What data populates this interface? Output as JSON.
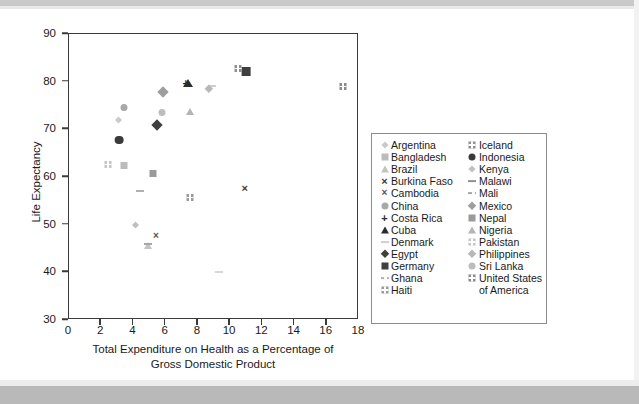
{
  "chart_data": {
    "type": "scatter",
    "title": "",
    "xlabel": "Total Expenditure on Health as a Percentage of Gross Domestic Product",
    "xlabel_line1": "Total Expenditure on Health as a Percentage of",
    "xlabel_line2": "Gross Domestic Product",
    "ylabel": "Life Expectancy",
    "xlim": [
      0,
      18
    ],
    "ylim": [
      30,
      90
    ],
    "xticks": [
      "0",
      "2",
      "4",
      "6",
      "8",
      "10",
      "12",
      "14",
      "16",
      "18"
    ],
    "yticks": [
      "30",
      "40",
      "50",
      "60",
      "70",
      "80",
      "90"
    ],
    "grid": false,
    "legend_position": "right",
    "points": [
      {
        "name": "Argentina",
        "x": 3.2,
        "y": 72.0,
        "marker": "diamond-small",
        "color": "#c9c9c9"
      },
      {
        "name": "Bangladesh",
        "x": 3.4,
        "y": 62.8,
        "marker": "square",
        "color": "#bcbcbc"
      },
      {
        "name": "Brazil",
        "x": 4.9,
        "y": 46.0,
        "marker": "triangle",
        "color": "#c4c4c4"
      },
      {
        "name": "Burkina Faso",
        "x": 10.9,
        "y": 58.0,
        "marker": "x-thin",
        "color": "#3a3a3a"
      },
      {
        "name": "Cambodia",
        "x": 5.4,
        "y": 48.0,
        "marker": "x-bold",
        "color": "#555555"
      },
      {
        "name": "China",
        "x": 3.4,
        "y": 74.8,
        "marker": "circle",
        "color": "#a8a8a8"
      },
      {
        "name": "Costa Rica",
        "x": 7.25,
        "y": 80.0,
        "marker": "plus",
        "color": "#2c2c2c"
      },
      {
        "name": "Cuba",
        "x": 7.4,
        "y": 80.0,
        "marker": "triangle",
        "color": "#2c2c2c"
      },
      {
        "name": "Denmark",
        "x": 8.85,
        "y": 80.0,
        "marker": "dash",
        "color": "#cfcfcf"
      },
      {
        "name": "Egypt",
        "x": 5.7,
        "y": 70.2,
        "marker": "diamond",
        "color": "#3f3f3f"
      },
      {
        "name": "Germany",
        "x": 11.0,
        "y": 82.2,
        "marker": "square",
        "color": "#3f3f3f"
      },
      {
        "name": "Ghana",
        "x": 4.4,
        "y": 58.0,
        "marker": "dash-dotted",
        "color": "#b0b0b0"
      },
      {
        "name": "Haiti",
        "x": 7.5,
        "y": 56.0,
        "marker": "square-grid",
        "color": "#9a9a9a"
      },
      {
        "name": "Iceland",
        "x": 10.5,
        "y": 83.0,
        "marker": "square-grid",
        "color": "#8f8f8f"
      },
      {
        "name": "Indonesia",
        "x": 3.1,
        "y": 67.9,
        "marker": "circle",
        "color": "#3a3a3a"
      },
      {
        "name": "Kenya",
        "x": 4.3,
        "y": 50.0,
        "marker": "diamond-small",
        "color": "#c0c0c0"
      },
      {
        "name": "Malawi",
        "x": 9.3,
        "y": 41.0,
        "marker": "dash",
        "color": "#d8d8d8"
      },
      {
        "name": "Mali",
        "x": 4.9,
        "y": 46.8,
        "marker": "dash-dotted",
        "color": "#a6a6a6"
      },
      {
        "name": "Mexico",
        "x": 6.1,
        "y": 77.1,
        "marker": "diamond",
        "color": "#9e9e9e"
      },
      {
        "name": "Nepal",
        "x": 5.2,
        "y": 61.0,
        "marker": "square",
        "color": "#9a9a9a"
      },
      {
        "name": "Nigeria",
        "x": 7.5,
        "y": 74.0,
        "marker": "triangle",
        "color": "#b4b4b4"
      },
      {
        "name": "Pakistan",
        "x": 2.4,
        "y": 63.0,
        "marker": "square-grid",
        "color": "#c4c4c4"
      },
      {
        "name": "Philippines",
        "x": 8.85,
        "y": 78.2,
        "marker": "diamond",
        "color": "#b8b8b8"
      },
      {
        "name": "Sri Lanka",
        "x": 5.8,
        "y": 73.8,
        "marker": "circle",
        "color": "#bdbdbd"
      },
      {
        "name": "United States of America",
        "x": 17.0,
        "y": 79.2,
        "marker": "square-grid",
        "color": "#8a8a8a"
      }
    ]
  },
  "legend": {
    "column1": [
      {
        "label": "Argentina",
        "marker": "diamond-small",
        "color": "#c9c9c9"
      },
      {
        "label": "Bangladesh",
        "marker": "square",
        "color": "#bcbcbc"
      },
      {
        "label": "Brazil",
        "marker": "triangle",
        "color": "#c4c4c4"
      },
      {
        "label": "Burkina Faso",
        "marker": "x-thin",
        "color": "#3a3a3a"
      },
      {
        "label": "Cambodia",
        "marker": "x-bold",
        "color": "#555555"
      },
      {
        "label": "China",
        "marker": "circle",
        "color": "#a8a8a8"
      },
      {
        "label": "Costa Rica",
        "marker": "plus",
        "color": "#2c2c2c"
      },
      {
        "label": "Cuba",
        "marker": "triangle",
        "color": "#2c2c2c"
      },
      {
        "label": "Denmark",
        "marker": "dash",
        "color": "#cfcfcf"
      },
      {
        "label": "Egypt",
        "marker": "diamond",
        "color": "#3f3f3f"
      },
      {
        "label": "Germany",
        "marker": "square",
        "color": "#3f3f3f"
      },
      {
        "label": "Ghana",
        "marker": "dash-dotted",
        "color": "#b0b0b0"
      },
      {
        "label": "Haiti",
        "marker": "square-grid",
        "color": "#9a9a9a"
      }
    ],
    "column2": [
      {
        "label": "Iceland",
        "marker": "square-grid",
        "color": "#8f8f8f"
      },
      {
        "label": "Indonesia",
        "marker": "circle",
        "color": "#3a3a3a"
      },
      {
        "label": "Kenya",
        "marker": "diamond-small",
        "color": "#c0c0c0"
      },
      {
        "label": "Malawi",
        "marker": "dash",
        "color": "#909090"
      },
      {
        "label": "Mali",
        "marker": "dash-dotted",
        "color": "#a6a6a6"
      },
      {
        "label": "Mexico",
        "marker": "diamond",
        "color": "#9e9e9e"
      },
      {
        "label": "Nepal",
        "marker": "square",
        "color": "#9a9a9a"
      },
      {
        "label": "Nigeria",
        "marker": "triangle",
        "color": "#b4b4b4"
      },
      {
        "label": "Pakistan",
        "marker": "square-grid",
        "color": "#c4c4c4"
      },
      {
        "label": "Philippines",
        "marker": "diamond",
        "color": "#b8b8b8"
      },
      {
        "label": "Sri Lanka",
        "marker": "circle",
        "color": "#bdbdbd"
      },
      {
        "label": "United States",
        "marker": "square-grid",
        "color": "#8a8a8a"
      }
    ],
    "continuation": "of America"
  }
}
